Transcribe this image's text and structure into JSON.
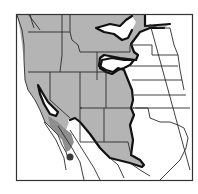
{
  "map": {
    "type": "species-range-map",
    "region": "Western North America",
    "colors": {
      "background": "#ffffff",
      "range_fill": "#b4b4b4",
      "range_fill_dark": "#8e8e8e",
      "range_outline": "#111111",
      "state_borders": "#2a2a2a",
      "frame": "#333333",
      "isolated_point": "#3a3a3a"
    },
    "legend": [],
    "labels": [],
    "features": [
      {
        "name": "main-range",
        "description": "Gray shaded distribution across western US"
      },
      {
        "name": "central-valley-gap",
        "description": "White excluded area in California Central Valley"
      },
      {
        "name": "northern-plains-gaps",
        "description": "White excluded lobes in Montana/Wyoming"
      },
      {
        "name": "baja-darker-band",
        "description": "Darker shaded band along Baja California coast"
      },
      {
        "name": "isolated-population",
        "description": "Dark circular point in southern Baja"
      }
    ]
  }
}
